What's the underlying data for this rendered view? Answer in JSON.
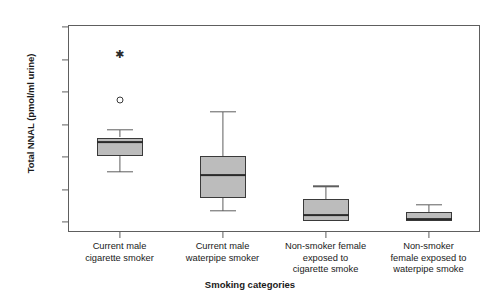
{
  "chart_data": {
    "type": "box",
    "title": "",
    "xlabel": "Smoking categories",
    "ylabel": "Total NNAL (pmol/ml urine)",
    "ylim": [
      0.0,
      3.0
    ],
    "ytick_labels": [
      "0.0",
      "0.5",
      "1.0",
      "1.5",
      "2.0",
      "2.5",
      "3.0"
    ],
    "ytick_values": [
      0.0,
      0.5,
      1.0,
      1.5,
      2.0,
      2.5,
      3.0
    ],
    "grid": false,
    "legend": "none",
    "box_fill_color": "#bcbcbc",
    "box_line_color": "#3a3a3a",
    "categories": [
      "Current male cigarette smoker",
      "Current male waterpipe smoker",
      "Non-smoker female exposed to cigarette smoke",
      "Non-smoker female exposed to waterpipe smoke"
    ],
    "category_label_lines": [
      [
        "Current male",
        "cigarette smoker"
      ],
      [
        "Current male",
        "waterpipe smoker"
      ],
      [
        "Non-smoker female",
        "exposed to",
        "cigarette smoke"
      ],
      [
        "Non-smoker",
        "female exposed to",
        "waterpipe smoke"
      ]
    ],
    "boxes": [
      {
        "category": "Current male cigarette smoker",
        "whisker_low": 0.77,
        "q1": 1.02,
        "median": 1.23,
        "q3": 1.3,
        "whisker_high": 1.42,
        "outliers": [
          1.88
        ],
        "extreme_outliers": [
          2.59
        ]
      },
      {
        "category": "Current male waterpipe smoker",
        "whisker_low": 0.17,
        "q1": 0.37,
        "median": 0.72,
        "q3": 1.02,
        "whisker_high": 1.7,
        "outliers": [],
        "extreme_outliers": []
      },
      {
        "category": "Non-smoker female exposed to cigarette smoke",
        "whisker_low": 0.02,
        "q1": 0.02,
        "median": 0.11,
        "q3": 0.35,
        "whisker_high": 0.55,
        "outliers": [],
        "extreme_outliers": []
      },
      {
        "category": "Non-smoker female exposed to waterpipe smoke",
        "whisker_low": 0.02,
        "q1": 0.02,
        "median": 0.04,
        "q3": 0.15,
        "whisker_high": 0.26,
        "outliers": [],
        "extreme_outliers": []
      }
    ]
  }
}
